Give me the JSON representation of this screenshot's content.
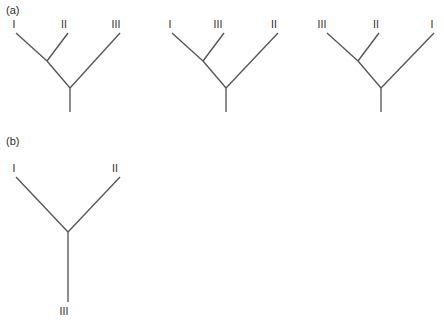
{
  "figure": {
    "line_color": "#555555",
    "text_color": "#2b2b2b",
    "background_color": "#ffffff",
    "width": 444,
    "height": 324
  },
  "panels": [
    {
      "id": "a",
      "label": "(a)",
      "label_x": 6,
      "label_y": 14,
      "trees": [
        {
          "id": "a1",
          "topology": "((I,II),III)",
          "taxa": [
            {
              "name": "I",
              "x": 14,
              "y": 28
            },
            {
              "name": "II",
              "x": 64,
              "y": 28
            },
            {
              "name": "III",
              "x": 116,
              "y": 28
            }
          ],
          "tip_points": [
            {
              "name": "I",
              "x": 16,
              "y": 33
            },
            {
              "name": "II",
              "x": 68,
              "y": 33
            },
            {
              "name": "III",
              "x": 120,
              "y": 33
            }
          ],
          "internal_node": {
            "x": 47,
            "y": 61
          },
          "root_node": {
            "x": 70,
            "y": 88
          },
          "root_stem_end": {
            "x": 70,
            "y": 112
          }
        },
        {
          "id": "a2",
          "topology": "((I,III),II)",
          "taxa": [
            {
              "name": "I",
              "x": 170,
              "y": 28
            },
            {
              "name": "III",
              "x": 218,
              "y": 28
            },
            {
              "name": "II",
              "x": 274,
              "y": 28
            }
          ],
          "tip_points": [
            {
              "name": "I",
              "x": 172,
              "y": 33
            },
            {
              "name": "III",
              "x": 224,
              "y": 33
            },
            {
              "name": "II",
              "x": 278,
              "y": 33
            }
          ],
          "internal_node": {
            "x": 203,
            "y": 61
          },
          "root_node": {
            "x": 226,
            "y": 88
          },
          "root_stem_end": {
            "x": 226,
            "y": 112
          }
        },
        {
          "id": "a3",
          "topology": "((III,II),I)",
          "taxa": [
            {
              "name": "III",
              "x": 322,
              "y": 28
            },
            {
              "name": "II",
              "x": 376,
              "y": 28
            },
            {
              "name": "I",
              "x": 432,
              "y": 28
            }
          ],
          "tip_points": [
            {
              "name": "III",
              "x": 327,
              "y": 33
            },
            {
              "name": "II",
              "x": 379,
              "y": 33
            },
            {
              "name": "I",
              "x": 434,
              "y": 33
            }
          ],
          "internal_node": {
            "x": 358,
            "y": 61
          },
          "root_node": {
            "x": 381,
            "y": 88
          },
          "root_stem_end": {
            "x": 381,
            "y": 112
          }
        }
      ]
    },
    {
      "id": "b",
      "label": "(b)",
      "label_x": 6,
      "label_y": 145,
      "trees": [
        {
          "id": "b1",
          "topology": "(I,II,III)",
          "taxa": [
            {
              "name": "I",
              "x": 14,
              "y": 172
            },
            {
              "name": "II",
              "x": 115,
              "y": 172
            },
            {
              "name": "III",
              "x": 64,
              "y": 315
            }
          ],
          "tip_points": [
            {
              "name": "I",
              "x": 16,
              "y": 177
            },
            {
              "name": "II",
              "x": 120,
              "y": 177
            },
            {
              "name": "III",
              "x": 68,
              "y": 302
            }
          ],
          "center_node": {
            "x": 68,
            "y": 232
          }
        }
      ]
    }
  ]
}
